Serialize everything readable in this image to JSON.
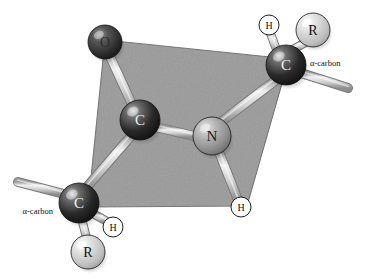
{
  "figure": {
    "background_color": "#ffffff",
    "plane_color": "#9a9a9a",
    "plane_edge_color": "#6f6f6f",
    "bond_color": "#d8d8d8",
    "bond_edge_color": "#787878"
  },
  "atoms": [
    {
      "id": "oxygen",
      "label": "O",
      "kind": "oxygen",
      "color": "#3a3a3a",
      "highlight": "#8e8e8e",
      "text_color": "#2b2b2b",
      "cx": 105,
      "cy": 42,
      "r": 17,
      "font_size": 14
    },
    {
      "id": "carbonyl-carbon",
      "label": "C",
      "kind": "carbon",
      "color": "#2e2e2e",
      "highlight": "#c9c9c9",
      "text_color": "#efefef",
      "cx": 140,
      "cy": 120,
      "r": 20,
      "font_size": 15
    },
    {
      "id": "nitrogen",
      "label": "N",
      "kind": "nitrogen",
      "color": "#9b9b9b",
      "highlight": "#d8d8d8",
      "text_color": "#1c1c1c",
      "cx": 212,
      "cy": 136,
      "r": 19,
      "font_size": 15
    },
    {
      "id": "alpha-carbon-right",
      "label": "C",
      "kind": "carbon",
      "color": "#2a2a2a",
      "highlight": "#c9c9c9",
      "text_color": "#efefef",
      "cx": 286,
      "cy": 65,
      "r": 20,
      "font_size": 15
    },
    {
      "id": "alpha-carbon-left",
      "label": "C",
      "kind": "carbon",
      "color": "#2a2a2a",
      "highlight": "#c9c9c9",
      "text_color": "#efefef",
      "cx": 79,
      "cy": 203,
      "r": 20,
      "font_size": 15
    },
    {
      "id": "r-group-right",
      "label": "R",
      "kind": "r-group",
      "color": "#cdcdcd",
      "highlight": "#f2f2f2",
      "text_color": "#101010",
      "cx": 313,
      "cy": 30,
      "r": 17,
      "font_size": 14
    },
    {
      "id": "r-group-left",
      "label": "R",
      "kind": "r-group",
      "color": "#cdcdcd",
      "highlight": "#f2f2f2",
      "text_color": "#101010",
      "cx": 88,
      "cy": 252,
      "r": 17,
      "font_size": 14
    },
    {
      "id": "hydrogen-top",
      "label": "H",
      "kind": "hydrogen",
      "color": "#ffffff",
      "highlight": "#ffffff",
      "text_color": "#101010",
      "cx": 269,
      "cy": 25,
      "r": 10,
      "font_size": 10
    },
    {
      "id": "hydrogen-amide",
      "label": "H",
      "kind": "hydrogen",
      "color": "#ffffff",
      "highlight": "#ffffff",
      "text_color": "#101010",
      "cx": 241,
      "cy": 207,
      "r": 10,
      "font_size": 10
    },
    {
      "id": "hydrogen-bottom",
      "label": "H",
      "kind": "hydrogen",
      "color": "#ffffff",
      "highlight": "#ffffff",
      "text_color": "#101010",
      "cx": 113,
      "cy": 227,
      "r": 10,
      "font_size": 10
    }
  ],
  "bonds": [
    {
      "id": "bond-o-c",
      "from": "oxygen",
      "to": "carbonyl-carbon",
      "x1": 108,
      "y1": 52,
      "x2": 136,
      "y2": 113,
      "width": 8
    },
    {
      "id": "bond-c-n",
      "from": "carbonyl-carbon",
      "to": "nitrogen",
      "x1": 156,
      "y1": 127,
      "x2": 198,
      "y2": 137,
      "width": 8
    },
    {
      "id": "bond-c-ca-left",
      "from": "carbonyl-carbon",
      "to": "alpha-carbon-left",
      "x1": 131,
      "y1": 136,
      "x2": 86,
      "y2": 188,
      "width": 8
    },
    {
      "id": "bond-n-ca-right",
      "from": "nitrogen",
      "to": "alpha-carbon-right",
      "x1": 221,
      "y1": 122,
      "x2": 276,
      "y2": 80,
      "width": 8
    },
    {
      "id": "bond-n-h",
      "from": "nitrogen",
      "to": "hydrogen-amide",
      "x1": 219,
      "y1": 152,
      "x2": 238,
      "y2": 200,
      "width": 8
    },
    {
      "id": "bond-ca-right-h",
      "from": "alpha-carbon-right",
      "to": "hydrogen-top",
      "x1": 277,
      "y1": 51,
      "x2": 270,
      "y2": 32,
      "width": 7
    },
    {
      "id": "bond-ca-right-r",
      "from": "alpha-carbon-right",
      "to": "r-group-right",
      "x1": 292,
      "y1": 50,
      "x2": 308,
      "y2": 41,
      "width": 7
    },
    {
      "id": "bond-ca-right-free",
      "from": "alpha-carbon-right",
      "to": "free-end-right",
      "x1": 301,
      "y1": 73,
      "x2": 348,
      "y2": 88,
      "width": 8
    },
    {
      "id": "bond-ca-left-h",
      "from": "alpha-carbon-left",
      "to": "hydrogen-bottom",
      "x1": 92,
      "y1": 213,
      "x2": 108,
      "y2": 222,
      "width": 7
    },
    {
      "id": "bond-ca-left-r",
      "from": "alpha-carbon-left",
      "to": "r-group-left",
      "x1": 82,
      "y1": 220,
      "x2": 87,
      "y2": 240,
      "width": 7
    },
    {
      "id": "bond-ca-left-free",
      "from": "alpha-carbon-left",
      "to": "free-end-left",
      "x1": 64,
      "y1": 194,
      "x2": 18,
      "y2": 182,
      "width": 8
    }
  ],
  "plane": {
    "id": "amide-plane",
    "points": "105,40 289,59 247,206 88,207"
  },
  "annotations": [
    {
      "id": "alpha-carbon-label-right",
      "text": "α-carbon",
      "x": 310,
      "y": 63,
      "anchor": "start"
    },
    {
      "id": "alpha-carbon-label-left",
      "text": "α-carbon",
      "x": 53,
      "y": 211,
      "anchor": "end"
    }
  ]
}
